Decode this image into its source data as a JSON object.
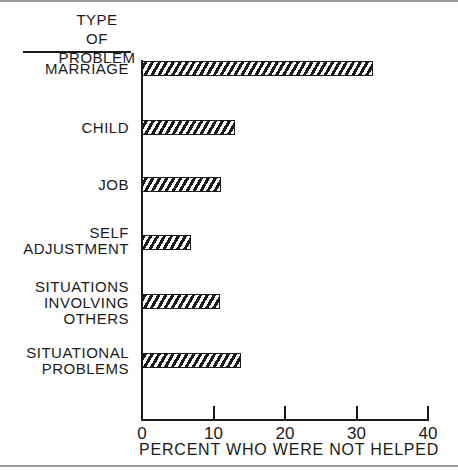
{
  "chart_data": {
    "type": "bar",
    "orientation": "horizontal",
    "title": "",
    "ylabel": "TYPE OF PROBLEM",
    "xlabel": "PERCENT WHO WERE NOT HELPED",
    "categories": [
      "MARRIAGE",
      "CHILD",
      "JOB",
      "SELF\nADJUSTMENT",
      "SITUATIONS\nINVOLVING\nOTHERS",
      "SITUATIONAL\nPROBLEMS"
    ],
    "values": [
      32.4,
      13.2,
      11.2,
      7.0,
      11.1,
      14.0
    ],
    "xlim": [
      0,
      40
    ],
    "xticks": [
      0,
      10,
      20,
      30,
      40
    ],
    "xtick_labels": [
      "0",
      "10",
      "20",
      "30",
      "40"
    ],
    "grid": false,
    "legend": null,
    "bar_fill": "diagonal hatch"
  },
  "labels": {
    "ytitle_line1": "TYPE",
    "ytitle_line2": "OF PROBLEM",
    "xlabel": "PERCENT WHO WERE NOT HELPED",
    "categories": [
      "MARRIAGE",
      "CHILD",
      "JOB",
      "SELF\nADJUSTMENT",
      "SITUATIONS\nINVOLVING\nOTHERS",
      "SITUATIONAL\nPROBLEMS"
    ],
    "ticks": [
      "0",
      "10",
      "20",
      "30",
      "40"
    ]
  },
  "colors": {
    "ink": "#1a1a1a",
    "background": "#ffffff",
    "frame_rule": "#9a9a9a"
  }
}
